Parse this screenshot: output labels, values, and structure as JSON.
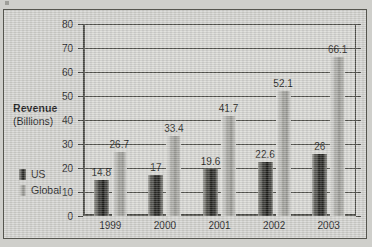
{
  "chart_data": {
    "type": "bar",
    "title": "",
    "xlabel": "",
    "ylabel": "Revenue (Billions)",
    "ylabel_line1": "Revenue",
    "ylabel_line2": "(Billions)",
    "categories": [
      "1999",
      "2000",
      "2001",
      "2002",
      "2003"
    ],
    "series": [
      {
        "name": "US",
        "values": [
          14.8,
          17,
          19.6,
          22.6,
          26
        ],
        "labels": [
          "14.8",
          "17",
          "19.6",
          "22.6",
          "26"
        ],
        "color": "#2b2b27"
      },
      {
        "name": "Global",
        "values": [
          26.7,
          33.4,
          41.7,
          52.1,
          66.1
        ],
        "labels": [
          "26.7",
          "33.4",
          "41.7",
          "52.1",
          "66.1"
        ],
        "color": "#a4a49f"
      }
    ],
    "ylim": [
      0,
      80
    ],
    "yticks": [
      0,
      10,
      20,
      30,
      40,
      50,
      60,
      70,
      80
    ],
    "ytick_labels": [
      "0",
      "10",
      "20",
      "30",
      "40",
      "50",
      "60",
      "70",
      "80"
    ],
    "grid": true,
    "legend_position": "left-outside"
  },
  "legend": {
    "items": [
      {
        "label": "US"
      },
      {
        "label": "Global"
      }
    ]
  }
}
